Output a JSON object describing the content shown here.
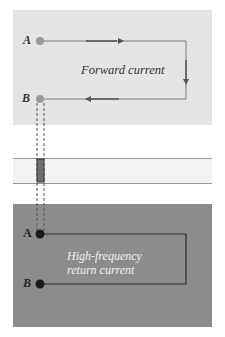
{
  "colors": {
    "top_panel_bg": "#e4e4e4",
    "mid_band_bg": "#f2f2f2",
    "bottom_panel_bg": "#8c8c8c",
    "top_wire": "#7a7a7a",
    "top_node": "#999999",
    "bottom_wire": "#2a2a2a",
    "bottom_node": "#1a1a1a",
    "via": "#6e6e6e",
    "top_text": "#333333",
    "bottom_text": "#f0f0f0"
  },
  "top_panel": {
    "node_a_label": "A",
    "node_b_label": "B",
    "caption": "Forward current"
  },
  "bottom_panel": {
    "node_a_label": "A",
    "node_b_label": "B",
    "caption_line1": "High-frequency",
    "caption_line2": "return current"
  }
}
